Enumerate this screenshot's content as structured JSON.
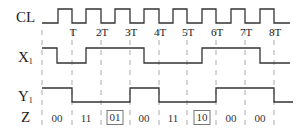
{
  "signals": {
    "cl": {
      "label": "CL",
      "sub": ""
    },
    "x1": {
      "label": "X",
      "sub": "1"
    },
    "y1": {
      "label": "Y",
      "sub": "1"
    },
    "z": {
      "label": "Z",
      "sub": ""
    }
  },
  "clock_ticks": [
    "T",
    "2T",
    "3T",
    "4T",
    "5T",
    "6T",
    "7T",
    "8T"
  ],
  "z_values": [
    {
      "text": "00",
      "boxed": false
    },
    {
      "text": "11",
      "boxed": false
    },
    {
      "text": "01",
      "boxed": true
    },
    {
      "text": "00",
      "boxed": false
    },
    {
      "text": "11",
      "boxed": false
    },
    {
      "text": "10",
      "boxed": true
    },
    {
      "text": "00",
      "boxed": false
    },
    {
      "text": "00",
      "boxed": false
    }
  ],
  "waveforms": {
    "cl": "low 42-58, then 8 pulses: high for half period, falling edges at T..8T",
    "x1": [
      1,
      0,
      1,
      1,
      0,
      0,
      1,
      1,
      0
    ],
    "y1": [
      1,
      0,
      0,
      1,
      0,
      0,
      1,
      1,
      0
    ]
  },
  "colors": {
    "line": "#333333",
    "dash": "#aaaaaa",
    "text": "#222222"
  }
}
